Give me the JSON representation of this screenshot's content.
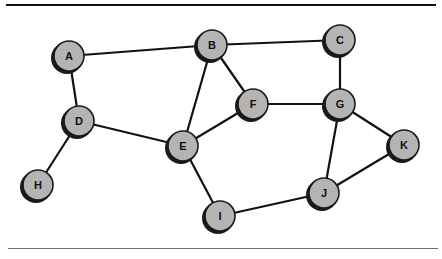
{
  "diagram": {
    "type": "undirected-graph",
    "node_radius": 15,
    "colors": {
      "node_fill": "#b4b4b4",
      "node_outline": "#1a1a1a",
      "edge": "#111111",
      "top_rule": "#111111",
      "bottom_rule": "#6e6e6e"
    },
    "nodes": [
      {
        "id": "A",
        "label": "A",
        "x": 69,
        "y": 56
      },
      {
        "id": "B",
        "label": "B",
        "x": 212,
        "y": 45
      },
      {
        "id": "C",
        "label": "C",
        "x": 340,
        "y": 40
      },
      {
        "id": "D",
        "label": "D",
        "x": 79,
        "y": 121
      },
      {
        "id": "E",
        "label": "E",
        "x": 183,
        "y": 146
      },
      {
        "id": "F",
        "label": "F",
        "x": 253,
        "y": 104
      },
      {
        "id": "G",
        "label": "G",
        "x": 340,
        "y": 104
      },
      {
        "id": "H",
        "label": "H",
        "x": 38,
        "y": 185
      },
      {
        "id": "I",
        "label": "I",
        "x": 220,
        "y": 216
      },
      {
        "id": "J",
        "label": "J",
        "x": 324,
        "y": 193
      },
      {
        "id": "K",
        "label": "K",
        "x": 404,
        "y": 145
      }
    ],
    "edges": [
      [
        "A",
        "B"
      ],
      [
        "A",
        "D"
      ],
      [
        "B",
        "C"
      ],
      [
        "B",
        "E"
      ],
      [
        "B",
        "F"
      ],
      [
        "C",
        "G"
      ],
      [
        "D",
        "E"
      ],
      [
        "D",
        "H"
      ],
      [
        "E",
        "F"
      ],
      [
        "E",
        "I"
      ],
      [
        "F",
        "G"
      ],
      [
        "G",
        "J"
      ],
      [
        "G",
        "K"
      ],
      [
        "I",
        "J"
      ],
      [
        "J",
        "K"
      ]
    ]
  }
}
